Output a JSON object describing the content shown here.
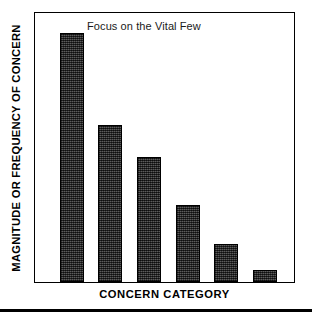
{
  "chart_data": {
    "type": "bar",
    "title": "Focus on the Vital Few",
    "xlabel": "CONCERN CATEGORY",
    "ylabel": "MAGNITUDE OR FREQUENCY OF CONCERN",
    "categories": [
      "1",
      "2",
      "3",
      "4",
      "5",
      "6"
    ],
    "values": [
      100,
      58,
      47,
      29,
      14,
      4.5
    ],
    "ylim": [
      0,
      100
    ],
    "xlim": [
      0,
      6
    ],
    "grid": false,
    "legend": null,
    "tick_labels": {
      "x": [],
      "y": []
    },
    "annotations": [],
    "bar_color": "#3b3b3b",
    "bar_edge_color": "#000000",
    "frame_color": "#000000",
    "background_color": "#ffffff",
    "series": [
      {
        "name": "Concern magnitude",
        "values": [
          100,
          58,
          47,
          29,
          14,
          4.5
        ]
      }
    ],
    "bar_geometry": [
      {
        "left_pct": 9.6,
        "width_pct": 9.2,
        "height_pct": 92.6
      },
      {
        "left_pct": 24.5,
        "width_pct": 9.2,
        "height_pct": 58.3
      },
      {
        "left_pct": 39.5,
        "width_pct": 9.2,
        "height_pct": 46.5
      },
      {
        "left_pct": 54.4,
        "width_pct": 9.2,
        "height_pct": 28.8
      },
      {
        "left_pct": 69.3,
        "width_pct": 9.2,
        "height_pct": 14.0
      },
      {
        "left_pct": 84.3,
        "width_pct": 9.2,
        "height_pct": 4.4
      }
    ]
  }
}
